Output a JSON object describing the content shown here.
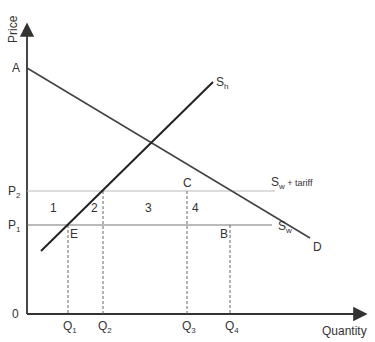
{
  "diagram": {
    "type": "economics-tariff-diagram",
    "axes": {
      "y_label": "Price",
      "x_label": "Quantity",
      "origin_label": "0"
    },
    "price_levels": [
      {
        "id": "P2",
        "label": "P",
        "sub": "2",
        "line": "Sw + tariff"
      },
      {
        "id": "P1",
        "label": "P",
        "sub": "1",
        "line": "Sw"
      }
    ],
    "quantity_levels": [
      {
        "id": "Q1",
        "label": "Q",
        "sub": "1"
      },
      {
        "id": "Q2",
        "label": "Q",
        "sub": "2"
      },
      {
        "id": "Q3",
        "label": "Q",
        "sub": "3"
      },
      {
        "id": "Q4",
        "label": "Q",
        "sub": "4"
      }
    ],
    "curves": {
      "demand": {
        "label": "D",
        "intercept_label": "A"
      },
      "domestic_supply": {
        "label": "S",
        "sub": "h"
      },
      "world_supply": {
        "label": "S",
        "sub": "w"
      },
      "world_supply_tariff": {
        "label": "S",
        "sub": "w",
        "suffix": " + tariff"
      }
    },
    "points": {
      "A": "A",
      "B": "B",
      "C": "C",
      "E": "E"
    },
    "regions": [
      "1",
      "2",
      "3",
      "4"
    ],
    "colors": {
      "axis": "#333333",
      "curve": "#222222",
      "demand": "#444444",
      "price_line_p1": "#777777",
      "price_line_p2": "#bbbbbb",
      "dashed": "#666666",
      "text": "#333333"
    }
  }
}
